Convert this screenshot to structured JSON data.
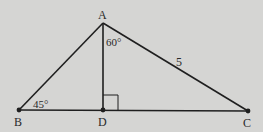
{
  "diagram": {
    "type": "triangle",
    "background": "#d5d5d3",
    "stroke": "#1f1f1f",
    "points": {
      "A": {
        "label": "A",
        "x": 103,
        "y": 23
      },
      "B": {
        "label": "B",
        "x": 19,
        "y": 110
      },
      "C": {
        "label": "C",
        "x": 248,
        "y": 111
      },
      "D": {
        "label": "D",
        "x": 103,
        "y": 110
      }
    },
    "segments": [
      "AB",
      "AC",
      "BC",
      "AD"
    ],
    "annotations": {
      "angle_B": "45°",
      "angle_DAC": "60°",
      "side_AC": "5",
      "right_angle_at": "D"
    }
  }
}
